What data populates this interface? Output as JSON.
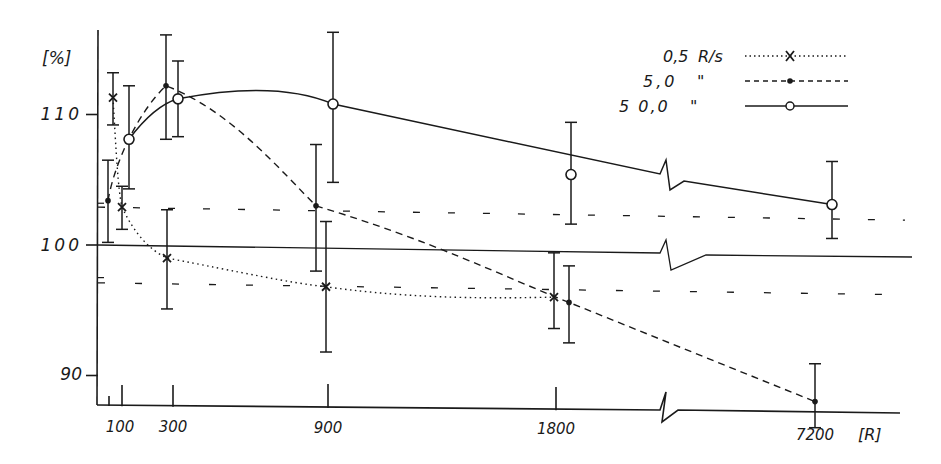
{
  "chart_data": {
    "type": "line",
    "title": "",
    "xlabel": "[R]",
    "ylabel": "[%]",
    "ylim": [
      86,
      117
    ],
    "x_tick_labels": [
      "100",
      "300",
      "900",
      "1800",
      "7200"
    ],
    "x_ticks": [
      100,
      300,
      900,
      1800,
      7200
    ],
    "x_minor_ticks": [
      50
    ],
    "y_tick_labels": [
      "90",
      "100",
      "110"
    ],
    "y_ticks": [
      90,
      100,
      110
    ],
    "x_axis_break": "between 1800 and 7200",
    "grid": false,
    "legend_position": "top-right",
    "reference_lines": [
      {
        "name": "baseline",
        "style": "solid",
        "y": 100
      },
      {
        "name": "upper-band",
        "style": "dashed",
        "y": 102.9
      },
      {
        "name": "lower-band",
        "style": "dashed",
        "y": 97.1
      }
    ],
    "series": [
      {
        "name": "0,5 R/s",
        "legend_label": "0,5",
        "legend_unit": "R/s",
        "line_style": "dotted",
        "marker": "x",
        "points": [
          {
            "x": 50,
            "y": 111.3,
            "err_hi": 113.2,
            "err_lo": 109.2
          },
          {
            "x": 100,
            "y": 102.9,
            "err_hi": 104.5,
            "err_lo": 101.2
          },
          {
            "x": 300,
            "y": 99.0,
            "err_hi": 102.7,
            "err_lo": 95.1
          },
          {
            "x": 900,
            "y": 96.8,
            "err_hi": 101.8,
            "err_lo": 91.8
          },
          {
            "x": 1800,
            "y": 96.0,
            "err_hi": 99.4,
            "err_lo": 93.6
          }
        ]
      },
      {
        "name": "5,0 R/s",
        "legend_label": "5,0",
        "legend_unit": "\"",
        "line_style": "dashed",
        "marker": "dot",
        "points": [
          {
            "x": 75,
            "y": 103.4,
            "err_hi": 106.5,
            "err_lo": 100.2
          },
          {
            "x": 300,
            "y": 112.2,
            "err_hi": 116.1,
            "err_lo": 108.1
          },
          {
            "x": 900,
            "y": 103.0,
            "err_hi": 107.7,
            "err_lo": 98.0
          },
          {
            "x": 1800,
            "y": 95.6,
            "err_hi": 98.4,
            "err_lo": 92.5
          },
          {
            "x": 7200,
            "y": 88.0,
            "err_hi": 90.9,
            "err_lo": 86.0
          }
        ]
      },
      {
        "name": "50,0 R/s",
        "legend_label": "5 0,0",
        "legend_unit": "\"",
        "line_style": "solid",
        "marker": "open-circle",
        "points": [
          {
            "x": 100,
            "y": 108.1,
            "err_hi": 112.2,
            "err_lo": 104.3
          },
          {
            "x": 300,
            "y": 111.2,
            "err_hi": 114.1,
            "err_lo": 108.3
          },
          {
            "x": 900,
            "y": 110.8,
            "err_hi": 116.3,
            "err_lo": 104.8
          },
          {
            "x": 1800,
            "y": 105.4,
            "err_hi": 109.4,
            "err_lo": 101.6
          },
          {
            "x": 7200,
            "y": 103.1,
            "err_hi": 106.4,
            "err_lo": 100.5
          }
        ]
      }
    ]
  }
}
